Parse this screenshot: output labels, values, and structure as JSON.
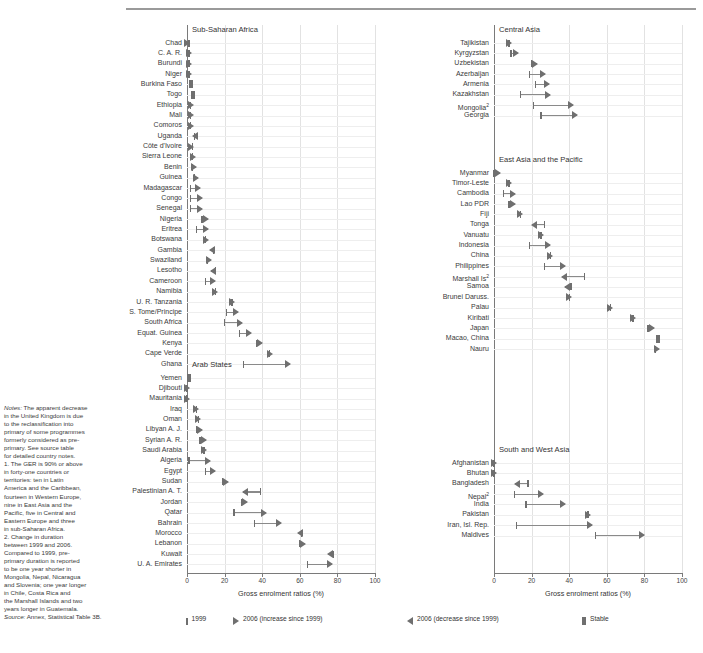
{
  "figure": {
    "xaxis_title": "Gross enrolment ratios (%)",
    "xticks": [
      0,
      20,
      40,
      60,
      80,
      100
    ]
  },
  "legend": {
    "items": [
      {
        "marker": "tick",
        "label": "1999"
      },
      {
        "marker": "triangle-right",
        "label": "2006 (increase since 1999)"
      },
      {
        "marker": "triangle-left",
        "label": "2006 (decrease since 1999)"
      },
      {
        "marker": "bar",
        "label": "Stable"
      }
    ]
  },
  "notes": {
    "lines": [
      "Notes: The apparent decrease",
      "in the United Kingdom is due",
      "to the reclassification into",
      "primary of some programmes",
      "formerly considered as pre-",
      "primary. See source table",
      "for detailed country notes.",
      "1. The GER is 90% or above",
      "in forty-one countries or",
      "territories: ten in Latin",
      "America and the Caribbean,",
      "fourteen in Western Europe,",
      "nine in East Asia and the",
      "Pacific, five in Central and",
      "Eastern Europe and three",
      "in sub-Saharan Africa.",
      "2. Change in duration",
      "between 1999 and 2006.",
      "Compared to 1999, pre-",
      "primary duration is reported",
      "to be one year shorter in",
      "Mongolia, Nepal, Nicaragua",
      "and Slovenia; one year longer",
      "in Chile, Costa Rica and",
      "the Marshall Islands and two",
      "years longer in Guatemala."
    ],
    "source_prefix": "Source:",
    "source_text": " Annex, Statistical Table 3B."
  },
  "chart_data": {
    "type": "range-dot",
    "title": "",
    "xlabel": "Gross enrolment ratios (%)",
    "ylabel": "",
    "xlim": [
      0,
      100
    ],
    "xticks": [
      0,
      20,
      40,
      60,
      80,
      100
    ],
    "grid": true,
    "legend_position": "bottom",
    "value_keys": {
      "v1999": "1999 value",
      "v2006": "2006 value",
      "direction": "increase | decrease | stable"
    },
    "panels": [
      {
        "name": "Sub-Saharan Africa",
        "column": "left",
        "rows": [
          {
            "label": "Chad",
            "v1999": 1,
            "v2006": 1,
            "direction": "increase"
          },
          {
            "label": "C. A. R.",
            "v1999": 1,
            "v2006": 2,
            "direction": "increase"
          },
          {
            "label": "Burundi",
            "v1999": 1,
            "v2006": 2,
            "direction": "increase"
          },
          {
            "label": "Niger",
            "v1999": 1,
            "v2006": 2,
            "direction": "increase"
          },
          {
            "label": "Burkina Faso",
            "v1999": 1,
            "v2006": 2,
            "direction": "stable"
          },
          {
            "label": "Togo",
            "v1999": 2,
            "v2006": 3,
            "direction": "stable"
          },
          {
            "label": "Ethiopia",
            "v1999": 2,
            "v2006": 3,
            "direction": "increase"
          },
          {
            "label": "Mali",
            "v1999": 2,
            "v2006": 3,
            "direction": "increase"
          },
          {
            "label": "Comoros",
            "v1999": 2,
            "v2006": 3,
            "direction": "increase"
          },
          {
            "label": "Uganda",
            "v1999": 4,
            "v2006": 3,
            "direction": "decrease"
          },
          {
            "label": "Côte d'Ivoire",
            "v1999": 3,
            "v2006": 3,
            "direction": "increase"
          },
          {
            "label": "Sierra Leone",
            "v1999": 3,
            "v2006": 4,
            "direction": "increase"
          },
          {
            "label": "Benin",
            "v1999": 3,
            "v2006": 5,
            "direction": "increase"
          },
          {
            "label": "Guinea",
            "v1999": 4,
            "v2006": 6,
            "direction": "increase"
          },
          {
            "label": "Madagascar",
            "v1999": 2,
            "v2006": 7,
            "direction": "increase"
          },
          {
            "label": "Congo",
            "v1999": 2,
            "v2006": 8,
            "direction": "increase"
          },
          {
            "label": "Senegal",
            "v1999": 2,
            "v2006": 8,
            "direction": "increase"
          },
          {
            "label": "Nigeria",
            "v1999": 8,
            "v2006": 11,
            "direction": "increase"
          },
          {
            "label": "Eritrea",
            "v1999": 5,
            "v2006": 11,
            "direction": "increase"
          },
          {
            "label": "Botswana",
            "v1999": 10,
            "v2006": 11,
            "direction": "increase"
          },
          {
            "label": "Gambia",
            "v1999": 14,
            "v2006": 12,
            "direction": "decrease"
          },
          {
            "label": "Swaziland",
            "v1999": 11,
            "v2006": 13,
            "direction": "increase"
          },
          {
            "label": "Lesotho",
            "v1999": 15,
            "v2006": 13,
            "direction": "decrease"
          },
          {
            "label": "Cameroon",
            "v1999": 10,
            "v2006": 15,
            "direction": "increase"
          },
          {
            "label": "Namibia",
            "v1999": 15,
            "v2006": 16,
            "direction": "increase"
          },
          {
            "label": "U. R. Tanzania",
            "v1999": 24,
            "v2006": 25,
            "direction": "increase"
          },
          {
            "label": "S. Tome/Principe",
            "v1999": 21,
            "v2006": 27,
            "direction": "increase"
          },
          {
            "label": "South Africa",
            "v1999": 20,
            "v2006": 29,
            "direction": "increase"
          },
          {
            "label": "Equat. Guinea",
            "v1999": 28,
            "v2006": 34,
            "direction": "increase"
          },
          {
            "label": "Kenya",
            "v1999": 37,
            "v2006": 40,
            "direction": "increase"
          },
          {
            "label": "Cape Verde",
            "v1999": 44,
            "v2006": 45,
            "direction": "increase"
          },
          {
            "label": "Ghana",
            "v1999": 30,
            "v2006": 55,
            "direction": "increase"
          }
        ]
      },
      {
        "name": "Arab States",
        "column": "left",
        "rows": [
          {
            "label": "Yemen",
            "v1999": 0,
            "v2006": 1,
            "direction": "stable"
          },
          {
            "label": "Djibouti",
            "v1999": 0,
            "v2006": 1,
            "direction": "increase"
          },
          {
            "label": "Mauritania",
            "v1999": 0,
            "v2006": 1,
            "direction": "increase"
          },
          {
            "label": "Iraq",
            "v1999": 5,
            "v2006": 6,
            "direction": "increase"
          },
          {
            "label": "Oman",
            "v1999": 6,
            "v2006": 7,
            "direction": "increase"
          },
          {
            "label": "Libyan A. J.",
            "v1999": 5,
            "v2006": 8,
            "direction": "increase"
          },
          {
            "label": "Syrian A. R.",
            "v1999": 7,
            "v2006": 10,
            "direction": "increase"
          },
          {
            "label": "Saudi Arabia",
            "v1999": 9,
            "v2006": 10,
            "direction": "increase"
          },
          {
            "label": "Algeria",
            "v1999": 1,
            "v2006": 12,
            "direction": "increase"
          },
          {
            "label": "Egypt",
            "v1999": 10,
            "v2006": 15,
            "direction": "increase"
          },
          {
            "label": "Sudan",
            "v1999": 19,
            "v2006": 22,
            "direction": "increase"
          },
          {
            "label": "Palestinian A. T.",
            "v1999": 39,
            "v2006": 30,
            "direction": "decrease"
          },
          {
            "label": "Jordan",
            "v1999": 29,
            "v2006": 32,
            "direction": "increase"
          },
          {
            "label": "Qatar",
            "v1999": 25,
            "v2006": 42,
            "direction": "increase"
          },
          {
            "label": "Bahrain",
            "v1999": 36,
            "v2006": 50,
            "direction": "increase"
          },
          {
            "label": "Morocco",
            "v1999": 61,
            "v2006": 59,
            "direction": "decrease"
          },
          {
            "label": "Lebanon",
            "v1999": 60,
            "v2006": 63,
            "direction": "increase"
          },
          {
            "label": "Kuwait",
            "v1999": 78,
            "v2006": 75,
            "direction": "decrease"
          },
          {
            "label": "U. A. Emirates",
            "v1999": 64,
            "v2006": 77,
            "direction": "increase"
          }
        ]
      },
      {
        "name": "Central Asia",
        "column": "right",
        "rows": [
          {
            "label": "Tajikistan",
            "v1999": 8,
            "v2006": 9,
            "direction": "increase"
          },
          {
            "label": "Kyrgyzstan",
            "v1999": 9,
            "v2006": 13,
            "direction": "increase"
          },
          {
            "label": "Uzbekistan",
            "v1999": 20,
            "v2006": 23,
            "direction": "increase"
          },
          {
            "label": "Azerbaijan",
            "v1999": 19,
            "v2006": 27,
            "direction": "increase"
          },
          {
            "label": "Armenia",
            "v1999": 22,
            "v2006": 29,
            "direction": "increase"
          },
          {
            "label": "Kazakhstan",
            "v1999": 14,
            "v2006": 30,
            "direction": "increase"
          },
          {
            "label": "Mongolia",
            "superscript": "2",
            "v1999": 21,
            "v2006": 42,
            "direction": "increase"
          },
          {
            "label": "Georgia",
            "v1999": 25,
            "v2006": 44,
            "direction": "increase"
          }
        ]
      },
      {
        "name": "East Asia and the Pacific",
        "column": "right",
        "rows": [
          {
            "label": "Myanmar",
            "v1999": 0,
            "v2006": 3,
            "direction": "increase"
          },
          {
            "label": "Timor-Leste",
            "v1999": 8,
            "v2006": 9,
            "direction": "increase"
          },
          {
            "label": "Cambodia",
            "v1999": 5,
            "v2006": 11,
            "direction": "increase"
          },
          {
            "label": "Lao PDR",
            "v1999": 8,
            "v2006": 11,
            "direction": "increase"
          },
          {
            "label": "Fiji",
            "v1999": 14,
            "v2006": 15,
            "direction": "increase"
          },
          {
            "label": "Tonga",
            "v1999": 27,
            "v2006": 20,
            "direction": "decrease"
          },
          {
            "label": "Vanuatu",
            "v1999": 25,
            "v2006": 26,
            "direction": "increase"
          },
          {
            "label": "Indonesia",
            "v1999": 19,
            "v2006": 30,
            "direction": "increase"
          },
          {
            "label": "China",
            "v1999": 30,
            "v2006": 31,
            "direction": "increase"
          },
          {
            "label": "Philippines",
            "v1999": 27,
            "v2006": 38,
            "direction": "increase"
          },
          {
            "label": "Marshall Is",
            "superscript": "2",
            "v1999": 48,
            "v2006": 36,
            "direction": "decrease"
          },
          {
            "label": "Samoa",
            "v1999": 41,
            "v2006": 38,
            "direction": "decrease"
          },
          {
            "label": "Brunei Daruss.",
            "v1999": 40,
            "v2006": 41,
            "direction": "increase"
          },
          {
            "label": "Palau",
            "v1999": 62,
            "v2006": 63,
            "direction": "increase"
          },
          {
            "label": "Kiribati",
            "v1999": 74,
            "v2006": 75,
            "direction": "increase"
          },
          {
            "label": "Japan",
            "v1999": 82,
            "v2006": 85,
            "direction": "increase"
          },
          {
            "label": "Macao, China",
            "v1999": 86,
            "v2006": 87,
            "direction": "stable"
          },
          {
            "label": "Nauru",
            "v1999": 86,
            "v2006": 88,
            "direction": "increase"
          }
        ]
      },
      {
        "name": "South and West Asia",
        "column": "right",
        "rows": [
          {
            "label": "Afghanistan",
            "v1999": 0,
            "v2006": 1,
            "direction": "increase"
          },
          {
            "label": "Bhutan",
            "v1999": 0,
            "v2006": 1,
            "direction": "increase"
          },
          {
            "label": "Bangladesh",
            "v1999": 18,
            "v2006": 11,
            "direction": "decrease"
          },
          {
            "label": "Nepal",
            "superscript": "2",
            "v1999": 11,
            "v2006": 26,
            "direction": "increase"
          },
          {
            "label": "India",
            "v1999": 17,
            "v2006": 38,
            "direction": "increase"
          },
          {
            "label": "Pakistan",
            "v1999": 50,
            "v2006": 51,
            "direction": "increase"
          },
          {
            "label": "Iran, Isl. Rep.",
            "v1999": 12,
            "v2006": 52,
            "direction": "increase"
          },
          {
            "label": "Maldives",
            "v1999": 54,
            "v2006": 80,
            "direction": "increase"
          }
        ]
      }
    ]
  }
}
